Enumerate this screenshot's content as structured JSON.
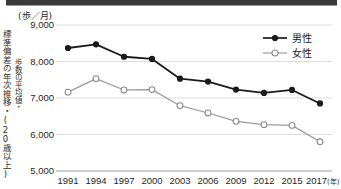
{
  "unit_label": "(歩／月)",
  "caption_outer": "標準偏差の年次推移・(20歳以上)",
  "caption_inner": "歩数の平均値・",
  "legend": {
    "male_label": "男性",
    "female_label": "女性",
    "male_color": "#1a1a1a",
    "female_color": "#9a9a9a"
  },
  "axis": {
    "y_ticks": [
      "9,000",
      "8,000",
      "7,000",
      "6,000",
      "5,000"
    ],
    "x_ticks": [
      "1991",
      "1994",
      "1997",
      "2000",
      "2003",
      "2006",
      "2009",
      "2012",
      "2015",
      "2017"
    ],
    "x_last_suffix": "(年)"
  },
  "chart_data": {
    "type": "line",
    "title": "",
    "subtitle": "",
    "xlabel": "(年)",
    "ylabel": "(歩／月)",
    "categories": [
      "1991",
      "1994",
      "1997",
      "2000",
      "2003",
      "2006",
      "2009",
      "2012",
      "2015",
      "2017"
    ],
    "series": [
      {
        "name": "男性",
        "color": "#1a1a1a",
        "marker": "filled-circle",
        "values": [
          8370,
          8470,
          8130,
          8070,
          7530,
          7450,
          7230,
          7140,
          7220,
          6850
        ]
      },
      {
        "name": "女性",
        "color": "#9a9a9a",
        "marker": "open-circle",
        "values": [
          7160,
          7530,
          7220,
          7230,
          6790,
          6590,
          6360,
          6270,
          6250,
          5800
        ]
      }
    ],
    "ylim": [
      5000,
      9000
    ],
    "ytick_values": [
      9000,
      8000,
      7000,
      6000,
      5000
    ],
    "grid": true,
    "legend_position": "top-right"
  }
}
